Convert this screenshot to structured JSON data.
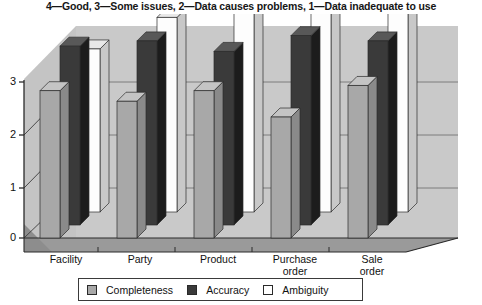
{
  "chart_data": {
    "type": "bar",
    "title": "4—Good, 3—Some issues, 2—Data causes problems, 1—Data inadequate to use",
    "subtitle": "",
    "xlabel": "",
    "ylabel": "",
    "ylim": [
      0,
      4
    ],
    "yticks": [
      0,
      1,
      2,
      3
    ],
    "ytick_labels": [
      "0",
      "1",
      "2",
      "3"
    ],
    "grid": true,
    "legend_position": "bottom",
    "three_d": true,
    "categories": [
      "Facility",
      "Party",
      "Product",
      "Purchase order",
      "Sale order"
    ],
    "category_labels": [
      "Facility",
      "Party",
      "Product",
      "Purchase\norder",
      "Sale\norder"
    ],
    "series": [
      {
        "name": "Completeness",
        "color": "#a8a8a8",
        "values": [
          2.8,
          2.6,
          2.8,
          2.3,
          2.9
        ]
      },
      {
        "name": "Accuracy",
        "color": "#3a3a3a",
        "values": [
          3.4,
          3.5,
          3.3,
          3.6,
          3.5
        ]
      },
      {
        "name": "Ambiguity",
        "color": "#fdfdfd",
        "values": [
          3.1,
          3.7,
          3.9,
          3.9,
          3.9
        ]
      }
    ]
  },
  "legend": {
    "items": [
      {
        "label": "Completeness",
        "swatch_color": "#a8a8a8"
      },
      {
        "label": "Accuracy",
        "swatch_color": "#3a3a3a"
      },
      {
        "label": "Ambiguity",
        "swatch_color": "#ffffff"
      }
    ]
  },
  "colors": {
    "wall_back": "#c9c9c9",
    "wall_side": "#bdbdbd",
    "floor": "#9a9a9a",
    "axis": "#2b2b2b",
    "gridline": "#555555",
    "bar_completeness_front": "#a8a8a8",
    "bar_completeness_top": "#c4c4c4",
    "bar_completeness_side": "#8a8a8a",
    "bar_accuracy_front": "#3a3a3a",
    "bar_accuracy_top": "#585858",
    "bar_accuracy_side": "#1c1c1c",
    "bar_ambiguity_front": "#fdfdfd",
    "bar_ambiguity_top": "#e8e8e8",
    "bar_ambiguity_side": "#c8c8c8"
  }
}
